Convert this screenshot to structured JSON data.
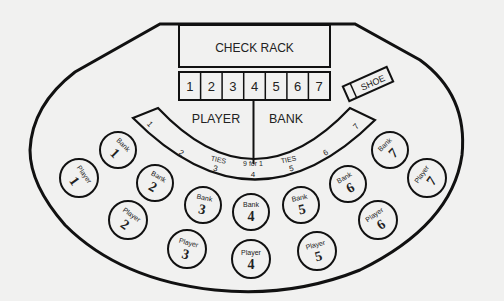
{
  "check_rack": {
    "label": "CHECK RACK"
  },
  "rack_slots": [
    "1",
    "2",
    "3",
    "4",
    "5",
    "6",
    "7"
  ],
  "shoe": {
    "label": "SHOE"
  },
  "betting_areas": {
    "player": "PLAYER",
    "bank": "BANK"
  },
  "tie_arc": {
    "numbers": [
      "1",
      "2",
      "3",
      "4",
      "5",
      "6",
      "7"
    ],
    "ties_left": "TIES",
    "ties_right": "TIES",
    "payout": "9 for 1"
  },
  "bank_spots": [
    {
      "label": "Bank",
      "number": "1"
    },
    {
      "label": "Bank",
      "number": "2"
    },
    {
      "label": "Bank",
      "number": "3"
    },
    {
      "label": "Bank",
      "number": "4"
    },
    {
      "label": "Bank",
      "number": "5"
    },
    {
      "label": "Bank",
      "number": "6"
    },
    {
      "label": "Bank",
      "number": "7"
    }
  ],
  "player_spots": [
    {
      "label": "Player",
      "number": "1"
    },
    {
      "label": "Player",
      "number": "2"
    },
    {
      "label": "Player",
      "number": "3"
    },
    {
      "label": "Player",
      "number": "4"
    },
    {
      "label": "Player",
      "number": "5"
    },
    {
      "label": "Player",
      "number": "6"
    },
    {
      "label": "Player",
      "number": "7"
    }
  ],
  "colors": {
    "line": "#111111",
    "background": "#f1f1f0",
    "text": "#222222"
  }
}
